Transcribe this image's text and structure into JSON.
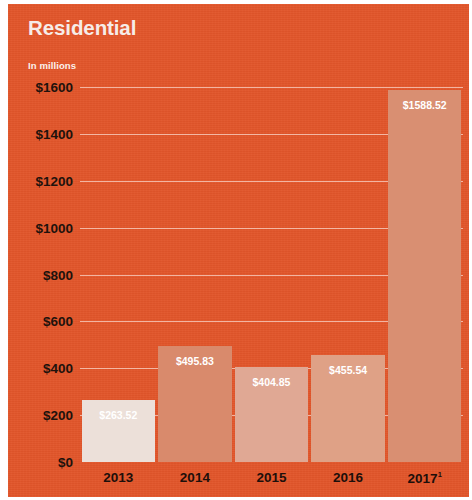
{
  "panel": {
    "title": "Residential",
    "units_label": "In millions",
    "background_color": "#e2562a"
  },
  "chart_data": {
    "type": "bar",
    "title": "Residential",
    "subtitle": "In millions",
    "xlabel": "",
    "ylabel": "In millions",
    "categories": [
      "2013",
      "2014",
      "2015",
      "2016",
      "2017"
    ],
    "category_labels": [
      "2013",
      "2014",
      "2015",
      "2016",
      "2017¹"
    ],
    "footnote_markers": [
      "",
      "",
      "",
      "",
      "1"
    ],
    "values": [
      263.52,
      495.83,
      404.85,
      455.54,
      1588.52
    ],
    "value_labels": [
      "$263.52",
      "$495.83",
      "$404.85",
      "$455.54",
      "$1588.52"
    ],
    "bar_colors": [
      "#ece0d9",
      "#d98a6c",
      "#e0a894",
      "#dfa186",
      "#d98f72"
    ],
    "ylim": [
      0,
      1600
    ],
    "y_ticks": [
      0,
      200,
      400,
      600,
      800,
      1000,
      1200,
      1400,
      1600
    ],
    "y_tick_labels": [
      "$0",
      "$200",
      "$400",
      "$600",
      "$800",
      "$1000",
      "$1200",
      "$1400",
      "$1600"
    ],
    "grid": true,
    "gridline_color": "#fff0eb",
    "legend": "none",
    "accent_color": "#e2562a"
  }
}
